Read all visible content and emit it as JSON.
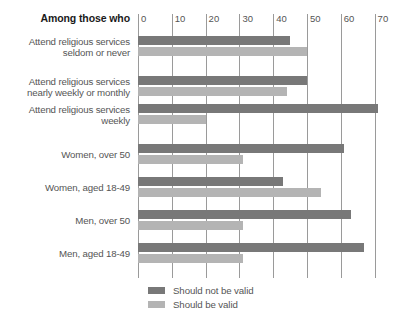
{
  "header": {
    "label_column_title": "Among those who"
  },
  "legend": {
    "position": "bottom-left",
    "entries": [
      {
        "label": "Should not be valid",
        "color": "#787878"
      },
      {
        "label": "Should be valid",
        "color": "#b4b4b4"
      }
    ]
  },
  "axis": {
    "ticks": [
      "0",
      "10",
      "20",
      "30",
      "40",
      "50",
      "60",
      "70"
    ],
    "min": 0,
    "max": 76
  },
  "colors": {
    "should_not_be_valid": "#787878",
    "should_be_valid": "#b4b4b4",
    "gridline": "#9a9a9a",
    "text": "#555555",
    "header_text": "#1a1a1a",
    "background": "#ffffff"
  },
  "chart_data": {
    "type": "bar",
    "orientation": "horizontal",
    "grouped": true,
    "title": "",
    "subtitle": "",
    "xlabel": "",
    "ylabel": "",
    "xlim": [
      0,
      76
    ],
    "grid": true,
    "legend_position": "bottom-left",
    "categories": [
      "Attend religious services\nseldom or never",
      "Attend religious services\nnearly weekly or monthly",
      "Attend religious services\nweekly",
      "Women, over 50",
      "Women, aged 18-49",
      "Men, over 50",
      "Men, aged 18-49"
    ],
    "series": [
      {
        "name": "Should not be valid",
        "color": "#787878",
        "values": [
          45,
          50,
          71,
          61,
          43,
          63,
          67
        ]
      },
      {
        "name": "Should be valid",
        "color": "#b4b4b4",
        "values": [
          50,
          44,
          20,
          31,
          54,
          31,
          31
        ]
      }
    ]
  },
  "groups": [
    {
      "label": "Attend religious services\nseldom or never",
      "dark": 45,
      "light": 50,
      "top": 36,
      "label_top": 36
    },
    {
      "label": "Attend religious services\nnearly weekly or monthly",
      "dark": 50,
      "light": 44,
      "top": 76,
      "label_top": 76
    },
    {
      "label": "Attend religious services\nweekly",
      "dark": 71,
      "light": 20,
      "top": 104,
      "label_top": 104
    },
    {
      "label": "Women, over 50",
      "dark": 61,
      "light": 31,
      "top": 144,
      "label_top": 149
    },
    {
      "label": "Women, aged 18-49",
      "dark": 43,
      "light": 54,
      "top": 177,
      "label_top": 182
    },
    {
      "label": "Men, over 50",
      "dark": 63,
      "light": 31,
      "top": 210,
      "label_top": 215
    },
    {
      "label": "Men, aged 18-49",
      "dark": 67,
      "light": 31,
      "top": 243,
      "label_top": 248
    }
  ]
}
